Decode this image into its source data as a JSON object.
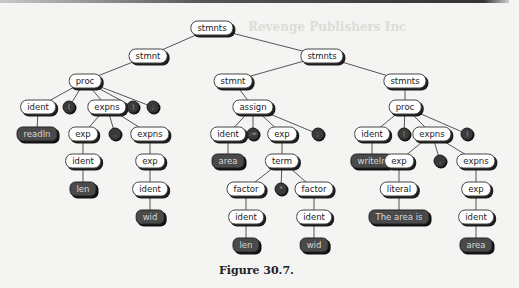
{
  "figure": {
    "caption": "Figure 30.7.",
    "background_heading": "Revenge Publishers Inc"
  },
  "tree": {
    "nodes": [
      {
        "id": "n0",
        "label": "stmnts",
        "kind": "nt",
        "x": 212,
        "y": 28
      },
      {
        "id": "n1",
        "label": "stmnt",
        "kind": "nt",
        "x": 148,
        "y": 56
      },
      {
        "id": "n2",
        "label": "stmnts",
        "kind": "nt",
        "x": 322,
        "y": 56
      },
      {
        "id": "n3",
        "label": "proc",
        "kind": "nt",
        "x": 85,
        "y": 81
      },
      {
        "id": "n4",
        "label": "stmnt",
        "kind": "nt",
        "x": 233,
        "y": 81
      },
      {
        "id": "n5",
        "label": "stmnts",
        "kind": "nt",
        "x": 405,
        "y": 81
      },
      {
        "id": "n6",
        "label": "ident",
        "kind": "nt",
        "x": 38,
        "y": 107
      },
      {
        "id": "n7",
        "label": "(",
        "kind": "tok",
        "x": 69,
        "y": 107
      },
      {
        "id": "n8",
        "label": "expns",
        "kind": "nt",
        "x": 107,
        "y": 107
      },
      {
        "id": "n9",
        "label": ")",
        "kind": "tok",
        "x": 133,
        "y": 107
      },
      {
        "id": "n10",
        "label": ";",
        "kind": "tok",
        "x": 153,
        "y": 107
      },
      {
        "id": "n11",
        "label": "assign",
        "kind": "nt",
        "x": 253,
        "y": 107
      },
      {
        "id": "n12",
        "label": "proc",
        "kind": "nt",
        "x": 405,
        "y": 107
      },
      {
        "id": "n13",
        "label": "readln",
        "kind": "leaf",
        "x": 37,
        "y": 134
      },
      {
        "id": "n14",
        "label": "exp",
        "kind": "nt",
        "x": 83,
        "y": 134
      },
      {
        "id": "n15",
        "label": ",",
        "kind": "tok",
        "x": 115,
        "y": 134
      },
      {
        "id": "n16",
        "label": "expns",
        "kind": "nt",
        "x": 150,
        "y": 134
      },
      {
        "id": "n17",
        "label": "ident",
        "kind": "nt",
        "x": 228,
        "y": 134
      },
      {
        "id": "n18",
        "label": ":=",
        "kind": "tok",
        "x": 253,
        "y": 134
      },
      {
        "id": "n19",
        "label": "exp",
        "kind": "nt",
        "x": 282,
        "y": 134
      },
      {
        "id": "n20",
        "label": ";",
        "kind": "tok",
        "x": 318,
        "y": 134
      },
      {
        "id": "n21",
        "label": "ident",
        "kind": "nt",
        "x": 372,
        "y": 134
      },
      {
        "id": "n22",
        "label": "(",
        "kind": "tok",
        "x": 404,
        "y": 134
      },
      {
        "id": "n23",
        "label": "expns",
        "kind": "nt",
        "x": 432,
        "y": 134
      },
      {
        "id": "n24",
        "label": ")",
        "kind": "tok",
        "x": 467,
        "y": 134
      },
      {
        "id": "n25",
        "label": "ident",
        "kind": "nt",
        "x": 83,
        "y": 161
      },
      {
        "id": "n26",
        "label": "exp",
        "kind": "nt",
        "x": 150,
        "y": 161
      },
      {
        "id": "n27",
        "label": "area",
        "kind": "leaf",
        "x": 228,
        "y": 161
      },
      {
        "id": "n28",
        "label": "term",
        "kind": "nt",
        "x": 282,
        "y": 161
      },
      {
        "id": "n29",
        "label": "writeln",
        "kind": "leaf",
        "x": 372,
        "y": 161
      },
      {
        "id": "n30",
        "label": "exp",
        "kind": "nt",
        "x": 399,
        "y": 161
      },
      {
        "id": "n31",
        "label": ",",
        "kind": "tok",
        "x": 440,
        "y": 161
      },
      {
        "id": "n32",
        "label": "expns",
        "kind": "nt",
        "x": 476,
        "y": 161
      },
      {
        "id": "n33",
        "label": "len",
        "kind": "leaf",
        "x": 83,
        "y": 189
      },
      {
        "id": "n34",
        "label": "ident",
        "kind": "nt",
        "x": 150,
        "y": 189
      },
      {
        "id": "n35",
        "label": "factor",
        "kind": "nt",
        "x": 246,
        "y": 189
      },
      {
        "id": "n36",
        "label": "*",
        "kind": "tok",
        "x": 281,
        "y": 189
      },
      {
        "id": "n37",
        "label": "factor",
        "kind": "nt",
        "x": 314,
        "y": 189
      },
      {
        "id": "n38",
        "label": "literal",
        "kind": "nt",
        "x": 399,
        "y": 189
      },
      {
        "id": "n39",
        "label": "exp",
        "kind": "nt",
        "x": 476,
        "y": 189
      },
      {
        "id": "n40",
        "label": "wid",
        "kind": "leaf",
        "x": 150,
        "y": 217
      },
      {
        "id": "n41",
        "label": "ident",
        "kind": "nt",
        "x": 246,
        "y": 217
      },
      {
        "id": "n42",
        "label": "ident",
        "kind": "nt",
        "x": 314,
        "y": 217
      },
      {
        "id": "n43",
        "label": "The area is",
        "kind": "leaf",
        "x": 399,
        "y": 217
      },
      {
        "id": "n44",
        "label": "ident",
        "kind": "nt",
        "x": 476,
        "y": 217
      },
      {
        "id": "n45",
        "label": "len",
        "kind": "leaf",
        "x": 246,
        "y": 245
      },
      {
        "id": "n46",
        "label": "wid",
        "kind": "leaf",
        "x": 314,
        "y": 245
      },
      {
        "id": "n47",
        "label": "area",
        "kind": "leaf",
        "x": 476,
        "y": 245
      }
    ],
    "edges": [
      [
        "n0",
        "n1"
      ],
      [
        "n0",
        "n2"
      ],
      [
        "n1",
        "n3"
      ],
      [
        "n2",
        "n4"
      ],
      [
        "n2",
        "n5"
      ],
      [
        "n3",
        "n6"
      ],
      [
        "n3",
        "n7"
      ],
      [
        "n3",
        "n8"
      ],
      [
        "n3",
        "n9"
      ],
      [
        "n3",
        "n10"
      ],
      [
        "n4",
        "n11"
      ],
      [
        "n5",
        "n12"
      ],
      [
        "n6",
        "n13"
      ],
      [
        "n8",
        "n14"
      ],
      [
        "n8",
        "n15"
      ],
      [
        "n8",
        "n16"
      ],
      [
        "n11",
        "n17"
      ],
      [
        "n11",
        "n18"
      ],
      [
        "n11",
        "n19"
      ],
      [
        "n11",
        "n20"
      ],
      [
        "n12",
        "n21"
      ],
      [
        "n12",
        "n22"
      ],
      [
        "n12",
        "n23"
      ],
      [
        "n12",
        "n24"
      ],
      [
        "n14",
        "n25"
      ],
      [
        "n16",
        "n26"
      ],
      [
        "n17",
        "n27"
      ],
      [
        "n19",
        "n28"
      ],
      [
        "n21",
        "n29"
      ],
      [
        "n23",
        "n30"
      ],
      [
        "n23",
        "n31"
      ],
      [
        "n23",
        "n32"
      ],
      [
        "n25",
        "n33"
      ],
      [
        "n26",
        "n34"
      ],
      [
        "n28",
        "n35"
      ],
      [
        "n28",
        "n36"
      ],
      [
        "n28",
        "n37"
      ],
      [
        "n30",
        "n38"
      ],
      [
        "n32",
        "n39"
      ],
      [
        "n34",
        "n40"
      ],
      [
        "n35",
        "n41"
      ],
      [
        "n37",
        "n42"
      ],
      [
        "n38",
        "n43"
      ],
      [
        "n39",
        "n44"
      ],
      [
        "n41",
        "n45"
      ],
      [
        "n42",
        "n46"
      ],
      [
        "n44",
        "n47"
      ]
    ]
  }
}
